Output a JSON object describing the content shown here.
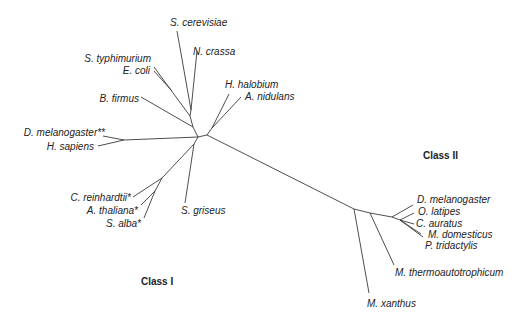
{
  "diagram": {
    "type": "unrooted phylogenetic tree",
    "class_labels": [
      {
        "id": "class1",
        "text": "Class I",
        "x": 141,
        "y": 285
      },
      {
        "id": "class2",
        "text": "Class II",
        "x": 423,
        "y": 159
      }
    ],
    "taxa": [
      {
        "name": "S. cerevisiae",
        "x": 170,
        "y": 26,
        "anchor": "start"
      },
      {
        "name": "N. crassa",
        "x": 193,
        "y": 55,
        "anchor": "start"
      },
      {
        "name": "S. typhimurium",
        "x": 151,
        "y": 62,
        "anchor": "end"
      },
      {
        "name": "E. coli",
        "x": 150,
        "y": 74,
        "anchor": "end"
      },
      {
        "name": "B. firmus",
        "x": 139,
        "y": 102,
        "anchor": "end"
      },
      {
        "name": "H. halobium",
        "x": 225,
        "y": 88,
        "anchor": "start"
      },
      {
        "name": "A. nidulans",
        "x": 245,
        "y": 100,
        "anchor": "start"
      },
      {
        "name": "D. melanogaster**",
        "x": 105,
        "y": 136,
        "anchor": "end"
      },
      {
        "name": "H. sapiens",
        "x": 94,
        "y": 150,
        "anchor": "end"
      },
      {
        "name": "C. reinhardtii*",
        "x": 131,
        "y": 201,
        "anchor": "end"
      },
      {
        "name": "A. thaliana*",
        "x": 138,
        "y": 214,
        "anchor": "end"
      },
      {
        "name": "S. alba*",
        "x": 141,
        "y": 227,
        "anchor": "end"
      },
      {
        "name": "S. griseus",
        "x": 181,
        "y": 214,
        "anchor": "start"
      },
      {
        "name": "D. melanogaster",
        "x": 417,
        "y": 203,
        "anchor": "start"
      },
      {
        "name": "O. latipes",
        "x": 418,
        "y": 215,
        "anchor": "start"
      },
      {
        "name": "C. auratus",
        "x": 416,
        "y": 227,
        "anchor": "start"
      },
      {
        "name": "M. domesticus",
        "x": 428,
        "y": 238,
        "anchor": "start"
      },
      {
        "name": "P. tridactylis",
        "x": 425,
        "y": 249,
        "anchor": "start"
      },
      {
        "name": "M. thermoautotrophicum",
        "x": 395,
        "y": 276,
        "anchor": "start"
      },
      {
        "name": "M. xanthus",
        "x": 367,
        "y": 307,
        "anchor": "start"
      }
    ]
  }
}
